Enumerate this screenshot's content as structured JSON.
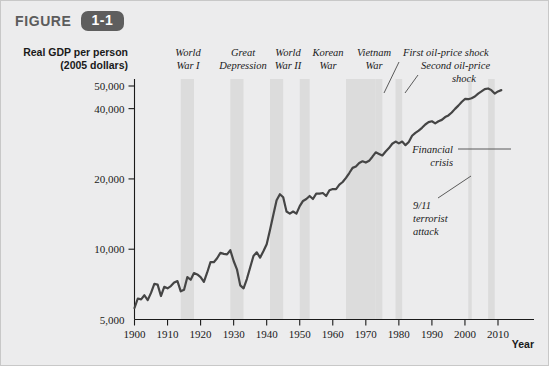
{
  "figure": {
    "word": "FIGURE",
    "number": "1-1"
  },
  "axis": {
    "y_title_line1": "Real GDP per person",
    "y_title_line2": "(2005 dollars)",
    "x_title": "Year"
  },
  "colors": {
    "background": "#ececed",
    "band": "#dcdcdc",
    "series": "#454545",
    "badge": "#5e5e5e",
    "text": "#1a1a1a"
  },
  "chart_data": {
    "type": "line",
    "title": "Real GDP per person (2005 dollars)",
    "xlabel": "Year",
    "ylabel": "Real GDP per person (2005 dollars)",
    "yscale": "log",
    "ylim": [
      5000,
      55000
    ],
    "xlim": [
      1900,
      2013
    ],
    "grid": false,
    "legend": "none",
    "ytick_labels": [
      "5,000",
      "10,000",
      "20,000",
      "40,000",
      "50,000"
    ],
    "ytick_values": [
      5000,
      10000,
      20000,
      40000,
      50000
    ],
    "xtick_labels": [
      "1900",
      "1910",
      "1920",
      "1930",
      "1940",
      "1950",
      "1960",
      "1970",
      "1980",
      "1990",
      "2000",
      "2010"
    ],
    "xtick_values": [
      1900,
      1910,
      1920,
      1930,
      1940,
      1950,
      1960,
      1970,
      1980,
      1990,
      2000,
      2010
    ],
    "series": [
      {
        "name": "Real GDP per person",
        "x": [
          1900,
          1901,
          1902,
          1903,
          1904,
          1905,
          1906,
          1907,
          1908,
          1909,
          1910,
          1911,
          1912,
          1913,
          1914,
          1915,
          1916,
          1917,
          1918,
          1919,
          1920,
          1921,
          1922,
          1923,
          1924,
          1925,
          1926,
          1927,
          1928,
          1929,
          1930,
          1931,
          1932,
          1933,
          1934,
          1935,
          1936,
          1937,
          1938,
          1939,
          1940,
          1941,
          1942,
          1943,
          1944,
          1945,
          1946,
          1947,
          1948,
          1949,
          1950,
          1951,
          1952,
          1953,
          1954,
          1955,
          1956,
          1957,
          1958,
          1959,
          1960,
          1961,
          1962,
          1963,
          1964,
          1965,
          1966,
          1967,
          1968,
          1969,
          1970,
          1971,
          1972,
          1973,
          1974,
          1975,
          1976,
          1977,
          1978,
          1979,
          1980,
          1981,
          1982,
          1983,
          1984,
          1985,
          1986,
          1987,
          1988,
          1989,
          1990,
          1991,
          1992,
          1993,
          1994,
          1995,
          1996,
          1997,
          1998,
          1999,
          2000,
          2001,
          2002,
          2003,
          2004,
          2005,
          2006,
          2007,
          2008,
          2009,
          2010,
          2011
        ],
        "y": [
          5600,
          6150,
          6100,
          6350,
          6050,
          6500,
          7100,
          7050,
          6300,
          6900,
          6800,
          6950,
          7200,
          7300,
          6600,
          6700,
          7600,
          7400,
          7900,
          7800,
          7600,
          7250,
          7950,
          8800,
          8800,
          9150,
          9650,
          9550,
          9500,
          9900,
          8900,
          8200,
          7000,
          6800,
          7450,
          8350,
          9350,
          9700,
          9200,
          9800,
          10500,
          12100,
          14000,
          16200,
          17200,
          16700,
          14500,
          14200,
          14500,
          14200,
          15300,
          16100,
          16400,
          16900,
          16400,
          17300,
          17300,
          17400,
          16900,
          17900,
          18100,
          18100,
          18900,
          19400,
          20200,
          21200,
          22300,
          22600,
          23400,
          23800,
          23500,
          23900,
          24900,
          26000,
          25600,
          25200,
          26200,
          27100,
          28300,
          28900,
          28400,
          28900,
          27900,
          28800,
          30600,
          31500,
          32200,
          33100,
          34200,
          35000,
          35300,
          34600,
          35300,
          35800,
          36800,
          37400,
          38500,
          39900,
          41200,
          42700,
          44000,
          43900,
          44300,
          45100,
          46400,
          47400,
          48500,
          48800,
          48000,
          46400,
          47400,
          48000
        ]
      }
    ],
    "shaded_bands": [
      {
        "label": "World War I",
        "start": 1914,
        "end": 1918
      },
      {
        "label": "Great Depression",
        "start": 1929,
        "end": 1933
      },
      {
        "label": "World War II",
        "start": 1941,
        "end": 1945
      },
      {
        "label": "Korean War",
        "start": 1950,
        "end": 1953
      },
      {
        "label": "Vietnam War",
        "start": 1964,
        "end": 1973
      },
      {
        "label": "First oil-price shock",
        "start": 1973,
        "end": 1975
      },
      {
        "label": "Second oil-price shock",
        "start": 1979,
        "end": 1981
      },
      {
        "label": "9/11 terrorist attack",
        "start": 2001,
        "end": 2002
      },
      {
        "label": "Financial crisis",
        "start": 2007,
        "end": 2009
      }
    ],
    "annotations": [
      {
        "text": "World War I",
        "lines": [
          "World",
          "War I"
        ]
      },
      {
        "text": "Great Depression",
        "lines": [
          "Great",
          "Depression"
        ]
      },
      {
        "text": "World War II",
        "lines": [
          "World",
          "War II"
        ]
      },
      {
        "text": "Korean War",
        "lines": [
          "Korean",
          "War"
        ]
      },
      {
        "text": "Vietnam War",
        "lines": [
          "Vietnam",
          "War"
        ]
      },
      {
        "text": "First oil-price shock",
        "lines": [
          "First oil-price shock"
        ]
      },
      {
        "text": "Second oil-price shock",
        "lines": [
          "Second oil-price",
          "shock"
        ]
      },
      {
        "text": "Financial crisis",
        "lines": [
          "Financial",
          "crisis"
        ]
      },
      {
        "text": "9/11 terrorist attack",
        "lines": [
          "9/11",
          "terrorist",
          "attack"
        ]
      }
    ]
  },
  "labels": {
    "ww1_l1": "World",
    "ww1_l2": "War I",
    "gd_l1": "Great",
    "gd_l2": "Depression",
    "ww2_l1": "World",
    "ww2_l2": "War II",
    "korea_l1": "Korean",
    "korea_l2": "War",
    "vietnam_l1": "Vietnam",
    "vietnam_l2": "War",
    "oil1": "First oil-price shock",
    "oil2_l1": "Second oil-price",
    "oil2_l2": "shock",
    "fin_l1": "Financial",
    "fin_l2": "crisis",
    "nine11_l1": "9/11",
    "nine11_l2": "terrorist",
    "nine11_l3": "attack"
  }
}
